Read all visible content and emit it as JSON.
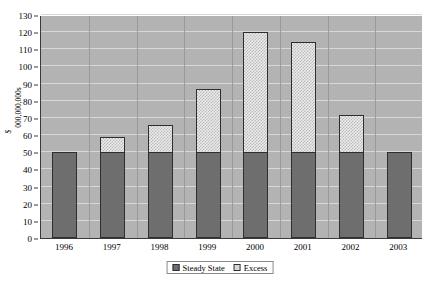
{
  "chart_data": {
    "type": "bar",
    "stacked": true,
    "title": "FULLBOND CAPITAL SPENDING:",
    "xlabel": "",
    "ylabel": "$ 000,000,000s",
    "ylabel_lines": [
      "$",
      "000,000,000s"
    ],
    "categories": [
      "1996",
      "1997",
      "1998",
      "1999",
      "2000",
      "2001",
      "2002",
      "2003"
    ],
    "series": [
      {
        "name": "Steady State",
        "values": [
          50,
          50,
          50,
          50,
          50,
          50,
          50,
          50
        ],
        "color": "#6e6e6e"
      },
      {
        "name": "Excess",
        "values": [
          0,
          9,
          16,
          37,
          70,
          64,
          22,
          0
        ],
        "color": "#ececec"
      }
    ],
    "totals": [
      50,
      59,
      66,
      87,
      120,
      114,
      72,
      50
    ],
    "ylim": [
      0,
      130
    ],
    "ytick_step": 10,
    "yticks": [
      0,
      10,
      20,
      30,
      40,
      50,
      60,
      70,
      80,
      90,
      100,
      110,
      120,
      130
    ],
    "grid": true,
    "legend_position": "bottom",
    "plot_background": "#b3b3b3",
    "gridline_color": "#d8d8d8"
  }
}
